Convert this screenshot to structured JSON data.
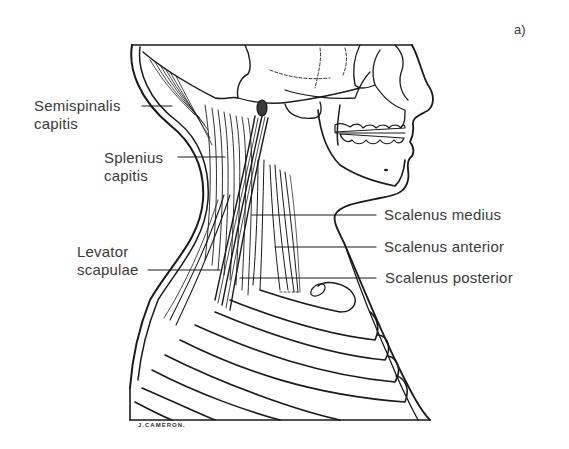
{
  "figure": {
    "panel_label": "a)",
    "signature": "J.CAMERON."
  },
  "labels": [
    {
      "id": "semispinalis",
      "line1": "Semispinalis",
      "line2": "capitis"
    },
    {
      "id": "splenius",
      "line1": "Splenius",
      "line2": "capitis"
    },
    {
      "id": "levator",
      "line1": "Levator",
      "line2": "scapulae"
    },
    {
      "id": "scalenus_medius",
      "line1": "Scalenus medius"
    },
    {
      "id": "scalenus_anterior",
      "line1": "Scalenus anterior"
    },
    {
      "id": "scalenus_posterior",
      "line1": "Scalenus posterior"
    }
  ],
  "colors": {
    "ink": "#1a1a1a",
    "text": "#3a3a3a",
    "background": "#ffffff"
  }
}
